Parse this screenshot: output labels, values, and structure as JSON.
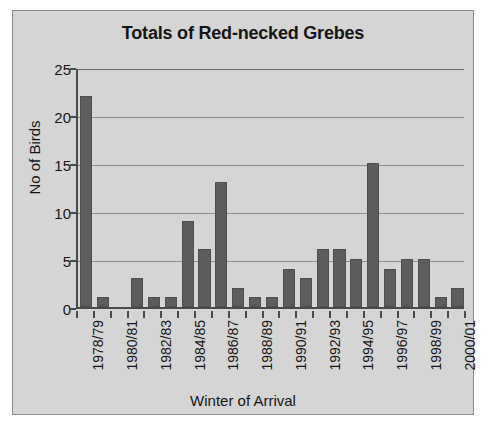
{
  "chart_data": {
    "type": "bar",
    "title": "Totals of Red-necked Grebes",
    "xlabel": "Winter of Arrival",
    "ylabel": "No of Birds",
    "ylim": [
      0,
      25
    ],
    "yticks": [
      0,
      5,
      10,
      15,
      20,
      25
    ],
    "ytick_labels": [
      "0",
      "5",
      "10",
      "15",
      "20",
      "25"
    ],
    "grid": "horizontal",
    "legend": "none",
    "bar_color": "#5d5d5d",
    "plot_background": "#d5d5d5",
    "label_interval": 2,
    "categories": [
      "1978/79",
      "1979/80",
      "1980/81",
      "1981/82",
      "1982/83",
      "1983/84",
      "1984/85",
      "1985/86",
      "1986/87",
      "1987/88",
      "1988/89",
      "1989/90",
      "1990/91",
      "1991/92",
      "1992/93",
      "1993/94",
      "1994/95",
      "1995/96",
      "1996/97",
      "1997/98",
      "1998/99",
      "1999/00",
      "2000/01"
    ],
    "values": [
      22,
      1,
      0,
      3,
      1,
      1,
      9,
      6,
      13,
      2,
      1,
      1,
      4,
      3,
      6,
      6,
      5,
      15,
      4,
      5,
      5,
      1,
      2
    ],
    "tick_labels": [
      "1978/79",
      "",
      "1980/81",
      "",
      "1982/83",
      "",
      "1984/85",
      "",
      "1986/87",
      "",
      "1988/89",
      "",
      "1990/91",
      "",
      "1992/93",
      "",
      "1994/95",
      "",
      "1996/97",
      "",
      "1998/99",
      "",
      "2000/01"
    ]
  }
}
